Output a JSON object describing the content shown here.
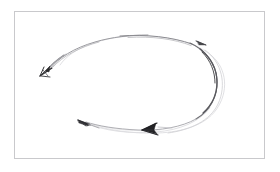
{
  "figure": {
    "title": "",
    "caption": "",
    "medium": "pencil-sketch",
    "background_color": "#ffffff",
    "frame": {
      "border_color": "#c9c9cc",
      "fill_color": "#ffffff",
      "x": 14,
      "y": 11,
      "width": 251,
      "height": 148
    },
    "ink": {
      "light_gray": "#cfcfd2",
      "mid_gray": "#9a9a9f",
      "dark_gray": "#6e6e73",
      "near_black": "#2b2b2d"
    },
    "strokes": [
      {
        "name": "outer-loop-primary",
        "description": "long sketched loop running from lower-left arrowhead up over the top, around the right turn, and back along the bottom",
        "color": "#8e8e93",
        "width": 1.0
      },
      {
        "name": "outer-loop-ghost",
        "description": "faint secondary pass of the loop offset outward on the right side",
        "color": "#d2d2d6",
        "width": 0.8
      },
      {
        "name": "right-turn-accent",
        "description": "darkest segment of the loop at the right-hand turn",
        "color": "#5a5a5f",
        "width": 1.2
      },
      {
        "name": "bottom-return",
        "description": "very faint bottom return line connecting the right turn back to the left",
        "color": "#dadade",
        "width": 0.8
      },
      {
        "name": "tail-to-left-arrow",
        "description": "line descending from the top-left of the loop to the terminal arrowhead",
        "color": "#8a8a8f",
        "width": 1.0
      }
    ],
    "arrowheads": [
      {
        "name": "terminal-arrowhead-left",
        "position": {
          "x": 44,
          "y": 72
        },
        "direction": "down-left",
        "color": "#2b2b2d",
        "size": "large"
      },
      {
        "name": "midway-arrowhead-bottom-left",
        "position": {
          "x": 84,
          "y": 122
        },
        "direction": "left",
        "color": "#3a3a3d",
        "size": "small"
      },
      {
        "name": "midway-arrowhead-bottom-center",
        "position": {
          "x": 150,
          "y": 128
        },
        "direction": "left",
        "color": "#232326",
        "size": "medium"
      },
      {
        "name": "tick-arrowhead-top-right",
        "position": {
          "x": 203,
          "y": 43
        },
        "direction": "right",
        "color": "#4a4a4e",
        "size": "tiny"
      }
    ]
  }
}
